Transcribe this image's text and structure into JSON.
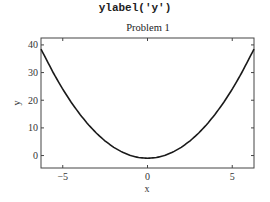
{
  "caption_code": "ylabel('y')",
  "chart_data": {
    "type": "line",
    "title": "Problem 1",
    "xlabel": "x",
    "ylabel": "y",
    "xlim": [
      -6.2832,
      6.2832
    ],
    "ylim": [
      -4.5,
      42.5
    ],
    "xticks": [
      -5,
      0,
      5
    ],
    "xtick_labels": [
      "−5",
      "0",
      "5"
    ],
    "yticks": [
      0,
      10,
      20,
      30,
      40
    ],
    "ytick_labels": [
      "0",
      "10",
      "20",
      "30",
      "40"
    ],
    "grid": false,
    "legend": null,
    "series": [
      {
        "name": "y = x^2 - 1",
        "color": "#1a1a1a",
        "x": [
          -6.2832,
          -5.5,
          -5,
          -4.5,
          -4,
          -3.5,
          -3,
          -2.5,
          -2,
          -1.5,
          -1,
          -0.5,
          0,
          0.5,
          1,
          1.5,
          2,
          2.5,
          3,
          3.5,
          4,
          4.5,
          5,
          5.5,
          6.2832
        ],
        "y": [
          38.48,
          29.25,
          24,
          19.25,
          15,
          11.25,
          8,
          5.25,
          3,
          1.25,
          0,
          -0.75,
          -1,
          -0.75,
          0,
          1.25,
          3,
          5.25,
          8,
          11.25,
          15,
          19.25,
          24,
          29.25,
          38.48
        ]
      }
    ]
  }
}
